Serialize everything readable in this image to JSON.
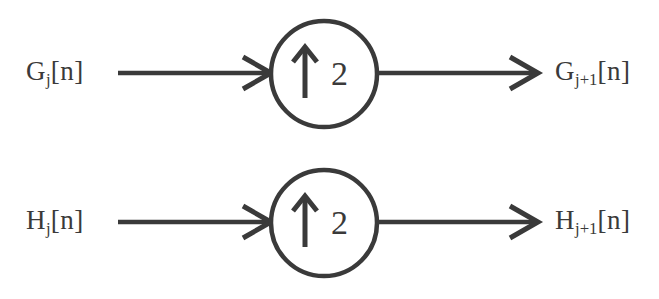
{
  "diagram": {
    "background_color": "#ffffff",
    "stroke_color": "#3a3a3a",
    "branches": [
      {
        "id": "g-branch",
        "input_label": "G",
        "input_subscript": "j",
        "input_index": "[n]",
        "output_label": "G",
        "output_subscript": "j+1",
        "output_index": "[n]",
        "operator_icon": "up-arrow-icon",
        "operator_factor": "2",
        "operator_meaning": "upsample by 2"
      },
      {
        "id": "h-branch",
        "input_label": "H",
        "input_subscript": "j",
        "input_index": "[n]",
        "output_label": "H",
        "output_subscript": "j+1",
        "output_index": "[n]",
        "operator_icon": "up-arrow-icon",
        "operator_factor": "2",
        "operator_meaning": "upsample by 2"
      }
    ]
  }
}
